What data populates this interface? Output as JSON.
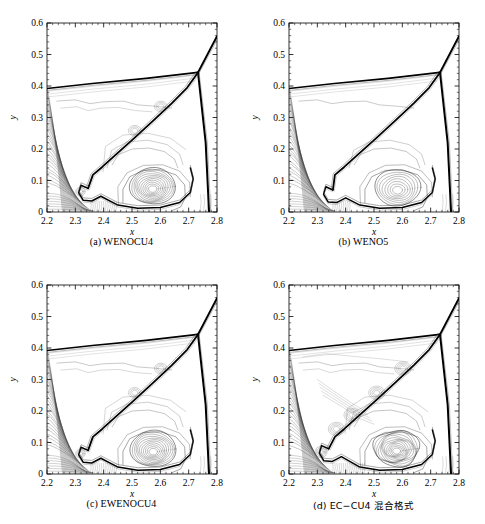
{
  "figure": {
    "kind": "contour-plot-grid",
    "rows": 2,
    "cols": 2,
    "background": "#ffffff",
    "line_color": "#000000"
  },
  "axes": {
    "xlabel": "x",
    "ylabel": "y",
    "xlim": [
      2.2,
      2.8
    ],
    "ylim": [
      0.0,
      0.6
    ],
    "xticks": [
      "2.2",
      "2.3",
      "2.4",
      "2.5",
      "2.6",
      "2.7",
      "2.8"
    ],
    "xtick_values": [
      2.2,
      2.3,
      2.4,
      2.5,
      2.6,
      2.7,
      2.8
    ],
    "yticks": [
      "0",
      "0.1",
      "0.2",
      "0.3",
      "0.4",
      "0.5",
      "0.6"
    ],
    "ytick_values": [
      0.0,
      0.1,
      0.2,
      0.3,
      0.4,
      0.5,
      0.6
    ],
    "minor_ticks_per_interval": 5,
    "tick_direction": "in",
    "grid": false
  },
  "panels": [
    {
      "id": "a",
      "caption": "(a) WENOCU4",
      "cjk": false,
      "detail": "high",
      "vortex_rings": 11,
      "jet_rollups": 2
    },
    {
      "id": "b",
      "caption": "(b) WENO5",
      "cjk": false,
      "detail": "low",
      "vortex_rings": 8,
      "jet_rollups": 0
    },
    {
      "id": "c",
      "caption": "(c) EWENOCU4",
      "cjk": false,
      "detail": "high",
      "vortex_rings": 11,
      "jet_rollups": 2
    },
    {
      "id": "d",
      "caption": "(d) EC−CU4 混合格式",
      "cjk": true,
      "detail": "highest",
      "vortex_rings": 13,
      "jet_rollups": 4
    }
  ],
  "chart_data": {
    "type": "line",
    "subtype": "density-contour",
    "title": "",
    "xlabel": "x",
    "ylabel": "y",
    "xlim": [
      2.2,
      2.8
    ],
    "ylim": [
      0.0,
      0.6
    ],
    "xticks": [
      2.2,
      2.3,
      2.4,
      2.5,
      2.6,
      2.7,
      2.8
    ],
    "yticks": [
      0.0,
      0.1,
      0.2,
      0.3,
      0.4,
      0.5,
      0.6
    ],
    "grid": false,
    "legend": "none",
    "series": [
      {
        "name": "(a) WENOCU4",
        "features": {
          "triple_point": [
            2.733,
            0.443
          ],
          "incident_shock_top": [
            2.8,
            0.558
          ],
          "mach_stem_foot": [
            2.772,
            0.0
          ],
          "reflected_shock_left_end": [
            2.2,
            0.392
          ],
          "slip_line_end": [
            2.345,
            0.075
          ],
          "primary_vortex_center": [
            2.573,
            0.072
          ],
          "jet_foot": [
            2.33,
            0.055
          ]
        }
      },
      {
        "name": "(b) WENO5",
        "features": {
          "triple_point": [
            2.733,
            0.443
          ],
          "incident_shock_top": [
            2.8,
            0.558
          ],
          "mach_stem_foot": [
            2.772,
            0.0
          ],
          "reflected_shock_left_end": [
            2.2,
            0.392
          ],
          "slip_line_end": [
            2.355,
            0.07
          ],
          "primary_vortex_center": [
            2.583,
            0.068
          ],
          "jet_foot": [
            2.34,
            0.05
          ]
        }
      },
      {
        "name": "(c) EWENOCU4",
        "features": {
          "triple_point": [
            2.733,
            0.443
          ],
          "incident_shock_top": [
            2.8,
            0.558
          ],
          "mach_stem_foot": [
            2.772,
            0.0
          ],
          "reflected_shock_left_end": [
            2.2,
            0.392
          ],
          "slip_line_end": [
            2.345,
            0.075
          ],
          "primary_vortex_center": [
            2.575,
            0.07
          ],
          "jet_foot": [
            2.33,
            0.055
          ]
        }
      },
      {
        "name": "(d) EC−CU4 混合格式",
        "features": {
          "triple_point": [
            2.733,
            0.443
          ],
          "incident_shock_top": [
            2.8,
            0.558
          ],
          "mach_stem_foot": [
            2.772,
            0.0
          ],
          "reflected_shock_left_end": [
            2.2,
            0.392
          ],
          "slip_line_end": [
            2.34,
            0.08
          ],
          "primary_vortex_center": [
            2.58,
            0.072
          ],
          "jet_foot": [
            2.325,
            0.06
          ]
        }
      }
    ]
  }
}
